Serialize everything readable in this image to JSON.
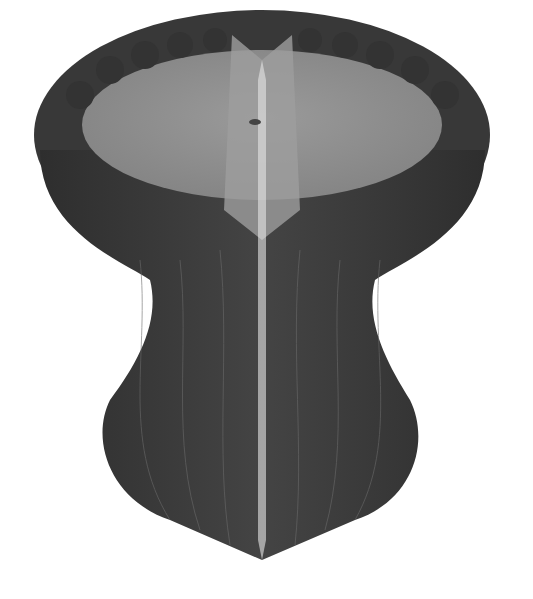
{
  "image": {
    "subject": "honeycomb paper lantern sculpture (hourglass/vase shape)",
    "background_color": "#ffffff",
    "colors": {
      "outer_dark": "#3a3a3a",
      "outer_mid": "#4a4a4a",
      "inner_light": "#8a8a8a",
      "inner_highlight": "#a8a8a8",
      "seam_lines": "#6e6e6e"
    }
  }
}
